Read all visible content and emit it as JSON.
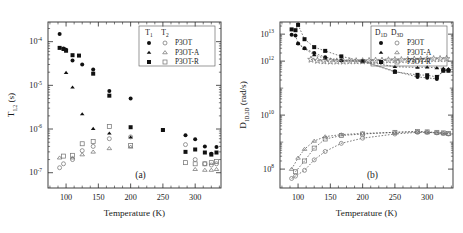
{
  "figure": {
    "panels": [
      {
        "id": "a",
        "label": "(a)",
        "xlabel": "Temperature  (K)",
        "ylabel_main": "T",
        "ylabel_sub": "1,2",
        "ylabel_unit": " (s)",
        "xticks": [
          100,
          150,
          200,
          250,
          300
        ],
        "xlim": [
          72,
          340
        ],
        "ylim_exp": [
          -7.35,
          -3.55
        ],
        "yticks_exp": [
          -4,
          -5,
          -6,
          -7
        ],
        "ytick_labels": [
          "10-4",
          "10-5",
          "10-6",
          "10-7"
        ],
        "legend": {
          "col1_head": "T",
          "col1_sub": "1",
          "col2_head": "T",
          "col2_sub": "2",
          "rows": [
            {
              "marker": "circle",
              "label": "P3OT"
            },
            {
              "marker": "triangle",
              "label": "P3OT-A"
            },
            {
              "marker": "square",
              "label": "P3OT-R"
            }
          ]
        }
      },
      {
        "id": "b",
        "label": "(b)",
        "xlabel": "Temperature  (K)",
        "ylabel_main": "D",
        "ylabel_sub": "1D,3D",
        "ylabel_unit": " (rad/s)",
        "xticks": [
          100,
          150,
          200,
          250,
          300
        ],
        "xlim": [
          72,
          340
        ],
        "ylim_exp": [
          7.3,
          13.45
        ],
        "yticks_exp": [
          13,
          12,
          10,
          8
        ],
        "ytick_labels": [
          "1013",
          "1012",
          "1010",
          "108"
        ],
        "legend": {
          "col1_head": "D",
          "col1_sub": "1D",
          "col2_head": "D",
          "col2_sub": "3D",
          "rows": [
            {
              "marker": "circle",
              "label": "P3OT"
            },
            {
              "marker": "triangle",
              "label": "P3OT-A"
            },
            {
              "marker": "square",
              "label": "P3OT-R"
            }
          ]
        }
      }
    ]
  },
  "chart_data": [
    {
      "type": "scatter",
      "panel": "a",
      "title": "",
      "xlabel": "Temperature (K)",
      "ylabel": "T1,2 (s)",
      "xlim": [
        72,
        340
      ],
      "ylim": [
        4.5e-08,
        0.00028
      ],
      "yscale": "log",
      "xscale": "linear",
      "grid": false,
      "legend_position": "upper-right",
      "series": [
        {
          "name": "T1 P3OT",
          "marker": "filled-circle",
          "x": [
            90,
            96,
            100,
            110,
            125,
            142,
            167,
            200,
            250,
            285,
            300,
            315,
            325,
            333
          ],
          "y": [
            0.00015,
            7e-05,
            6.5e-05,
            3.7e-05,
            3e-05,
            2.3e-05,
            7.4e-06,
            5e-06,
            9.5e-07,
            7.2e-07,
            5.8e-07,
            4e-07,
            2.7e-07,
            3.9e-07
          ]
        },
        {
          "name": "T1 P3OT-A",
          "marker": "filled-triangle",
          "x": [
            100,
            110,
            125,
            142,
            167,
            200
          ],
          "y": [
            1.95e-05,
            9e-06,
            2.2e-06,
            1.02e-06,
            8e-07,
            6.5e-07
          ]
        },
        {
          "name": "T1 P3OT-R",
          "marker": "filled-square",
          "x": [
            90,
            96,
            100,
            110,
            120,
            142,
            167,
            200,
            250,
            285,
            300,
            315,
            325,
            333
          ],
          "y": [
            7.2e-05,
            6.8e-05,
            6.2e-05,
            4.9e-05,
            4.8e-05,
            1.85e-05,
            5.8e-06,
            1.1e-06,
            9.5e-07,
            3e-07,
            3.4e-07,
            2.9e-07,
            2.6e-07,
            2.9e-07
          ]
        },
        {
          "name": "T2 P3OT",
          "marker": "open-circle",
          "x": [
            90,
            96,
            110,
            125,
            142,
            167,
            200,
            285,
            300,
            315,
            325,
            333
          ],
          "y": [
            1.3e-07,
            1.6e-07,
            2e-07,
            3.2e-07,
            4e-07,
            6e-07,
            6.6e-07,
            4.4e-07,
            2e-07,
            1.6e-07,
            1.5e-07,
            1.6e-07
          ]
        },
        {
          "name": "T2 P3OT-A",
          "marker": "open-triangle",
          "x": [
            90,
            110,
            125,
            142,
            167,
            200,
            300,
            315,
            325,
            333
          ],
          "y": [
            2.2e-07,
            2.2e-07,
            2.6e-07,
            3e-07,
            3.6e-07,
            3.9e-07,
            1.2e-07,
            1.15e-07,
            1.15e-07,
            1.2e-07
          ]
        },
        {
          "name": "T2 P3OT-R",
          "marker": "open-square",
          "x": [
            96,
            110,
            125,
            142,
            167,
            200,
            285,
            300,
            315,
            325,
            333
          ],
          "y": [
            2.4e-07,
            2.5e-07,
            4.6e-07,
            5.2e-07,
            1.15e-06,
            4.2e-07,
            1.7e-07,
            1.6e-07,
            1.6e-07,
            1.7e-07,
            1.8e-07
          ]
        }
      ]
    },
    {
      "type": "scatter",
      "panel": "b",
      "title": "",
      "xlabel": "Temperature (K)",
      "ylabel": "D1D,3D (rad/s)",
      "xlim": [
        72,
        340
      ],
      "ylim": [
        20000000.0,
        28000000000000.0
      ],
      "yscale": "log",
      "xscale": "linear",
      "grid": false,
      "legend_position": "upper-right",
      "series": [
        {
          "name": "D1D P3OT",
          "marker": "filled-circle",
          "x": [
            90,
            96,
            100,
            110,
            125,
            142,
            167,
            200,
            250,
            285,
            300,
            315,
            325,
            333
          ],
          "y": [
            9500000000000.0,
            9000000000000.0,
            4500000000000.0,
            3000000000000.0,
            2000000000000.0,
            1400000000000.0,
            1050000000000.0,
            1000000000000.0,
            420000000000.0,
            260000000000.0,
            240000000000.0,
            220000000000.0,
            460000000000.0,
            460000000000.0
          ]
        },
        {
          "name": "D1D P3OT-A",
          "marker": "filled-triangle",
          "x": [
            100,
            110,
            125,
            142,
            167,
            200,
            250,
            285,
            300,
            315,
            325,
            333
          ],
          "y": [
            4400000000000.0,
            2900000000000.0,
            1700000000000.0,
            1250000000000.0,
            1050000000000.0,
            1000000000000.0,
            620000000000.0,
            580000000000.0,
            600000000000.0,
            560000000000.0,
            540000000000.0,
            520000000000.0
          ]
        },
        {
          "name": "D1D P3OT-R",
          "marker": "filled-square",
          "x": [
            90,
            96,
            100,
            110,
            125,
            142,
            167,
            200,
            250,
            285,
            300,
            315,
            325,
            333
          ],
          "y": [
            15000000000000.0,
            14000000000000.0,
            22000000000000.0,
            6500000000000.0,
            3300000000000.0,
            2400000000000.0,
            1500000000000.0,
            1000000000000.0,
            400000000000.0,
            310000000000.0,
            300000000000.0,
            260000000000.0,
            440000000000.0,
            440000000000.0
          ]
        },
        {
          "name": "D3D P3OT",
          "marker": "open-circle",
          "x": [
            90,
            96,
            110,
            125,
            142,
            167,
            200,
            250,
            285,
            300,
            315,
            325,
            333
          ],
          "y": [
            45000000.0,
            55000000.0,
            90000000.0,
            220000000.0,
            450000000.0,
            900000000.0,
            1400000000.0,
            2000000000.0,
            2300000000.0,
            2300000000.0,
            2200000000.0,
            2100000000.0,
            2000000000.0
          ]
        },
        {
          "name": "D3D P3OT-A",
          "marker": "open-triangle",
          "x": [
            90,
            100,
            110,
            125,
            142,
            167,
            200,
            250,
            285,
            300,
            315,
            325,
            333
          ],
          "y": [
            100000000.0,
            260000000.0,
            550000000.0,
            1100000000.0,
            1600000000.0,
            1900000000.0,
            2100000000.0,
            2300000000.0,
            2400000000.0,
            2300000000.0,
            2200000000.0,
            2100000000.0,
            2000000000.0
          ]
        },
        {
          "name": "D3D P3OT-R",
          "marker": "open-square",
          "x": [
            96,
            110,
            125,
            142,
            167,
            200,
            250,
            285,
            300,
            315,
            325,
            333
          ],
          "y": [
            80000000.0,
            200000000.0,
            600000000.0,
            1300000000.0,
            1750000000.0,
            2000000000.0,
            2300000000.0,
            2500000000.0,
            2400000000.0,
            2300000000.0,
            2200000000.0,
            2100000000.0
          ]
        },
        {
          "name": "D3D-star-plateau",
          "marker": "open-star",
          "x": [
            120,
            130,
            140,
            150,
            160,
            170,
            180,
            190,
            200,
            210,
            220,
            230,
            240,
            250,
            260,
            270,
            280,
            290,
            300,
            310,
            320,
            330
          ],
          "y": [
            1150000000000.0,
            1050000000000.0,
            1000000000000.0,
            980000000000.0,
            980000000000.0,
            980000000000.0,
            1000000000000.0,
            1000000000000.0,
            1000000000000.0,
            1020000000000.0,
            1050000000000.0,
            1050000000000.0,
            1080000000000.0,
            1100000000000.0,
            1100000000000.0,
            1120000000000.0,
            1150000000000.0,
            1150000000000.0,
            1180000000000.0,
            1200000000000.0,
            1200000000000.0,
            1220000000000.0
          ]
        }
      ]
    }
  ]
}
